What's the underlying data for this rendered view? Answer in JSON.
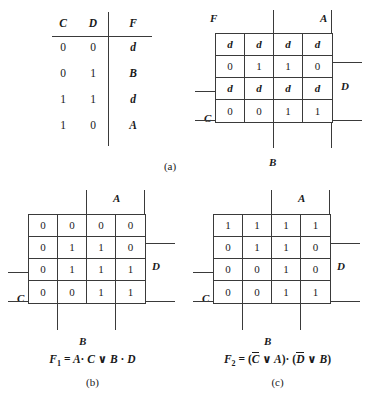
{
  "truth_table": {
    "headers": [
      "C",
      "D",
      "F"
    ],
    "rows": [
      {
        "c": "0",
        "d": "0",
        "f": "d"
      },
      {
        "c": "0",
        "d": "1",
        "f": "B"
      },
      {
        "c": "1",
        "d": "1",
        "f": "d"
      },
      {
        "c": "1",
        "d": "0",
        "f": "A"
      }
    ]
  },
  "panels": {
    "a": {
      "caption": "(a)",
      "labels": {
        "top_left": "F",
        "top_right": "A",
        "right": "D",
        "left": "C",
        "bottom": "B"
      },
      "cells": [
        [
          "d",
          "d",
          "d",
          "d"
        ],
        [
          "0",
          "1",
          "1",
          "0"
        ],
        [
          "d",
          "d",
          "d",
          "d"
        ],
        [
          "0",
          "0",
          "1",
          "1"
        ]
      ]
    },
    "b": {
      "caption": "(b)",
      "labels": {
        "top_right": "A",
        "right": "D",
        "left": "C",
        "bottom": "B"
      },
      "cells": [
        [
          "0",
          "0",
          "0",
          "0"
        ],
        [
          "0",
          "1",
          "1",
          "0"
        ],
        [
          "0",
          "1",
          "1",
          "1"
        ],
        [
          "0",
          "0",
          "1",
          "1"
        ]
      ],
      "formula": {
        "name": "F",
        "subscript": "1",
        "equals": "=",
        "text": "F1 = A · C ∨ B · D",
        "terms": [
          "A",
          "C",
          "B",
          "D"
        ],
        "and_op": "·",
        "or_op": "∨"
      }
    },
    "c": {
      "caption": "(c)",
      "labels": {
        "top_right": "A",
        "right": "D",
        "left": "C",
        "bottom": "B"
      },
      "cells": [
        [
          "1",
          "1",
          "1",
          "1"
        ],
        [
          "0",
          "1",
          "1",
          "0"
        ],
        [
          "0",
          "0",
          "1",
          "0"
        ],
        [
          "0",
          "0",
          "1",
          "1"
        ]
      ],
      "formula": {
        "name": "F",
        "subscript": "2",
        "equals": "=",
        "text": "F2 = (C̅ ∨ A) · (D̅ ∨ B)",
        "terms": [
          "C",
          "A",
          "D",
          "B"
        ],
        "and_op": "·",
        "or_op": "∨",
        "paren_open": "(",
        "paren_close": ")"
      }
    }
  },
  "colors": {
    "ink": "#1a1a1a",
    "rule": "#3a3a3a",
    "background": "#ffffff"
  }
}
